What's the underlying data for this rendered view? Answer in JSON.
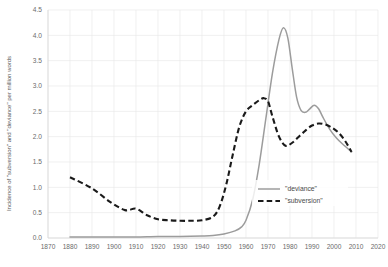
{
  "chart_data": {
    "type": "line",
    "title": "",
    "xlabel": "",
    "ylabel": "Incidence of \"subversion\" and \"deviance\" per million words",
    "xlim": [
      1870,
      2020
    ],
    "ylim": [
      0.0,
      4.5
    ],
    "xticks": [
      1870,
      1880,
      1890,
      1900,
      1910,
      1920,
      1930,
      1940,
      1950,
      1960,
      1970,
      1980,
      1990,
      2000,
      2010,
      2020
    ],
    "yticks": [
      0.0,
      0.5,
      1.0,
      1.5,
      2.0,
      2.5,
      3.0,
      3.5,
      4.0,
      4.5
    ],
    "grid": true,
    "legend_position": "lower right",
    "series": [
      {
        "name": "\"deviance\"",
        "style": "solid",
        "color": "#9c9c9c",
        "x": [
          1880,
          1890,
          1900,
          1910,
          1920,
          1930,
          1940,
          1945,
          1950,
          1955,
          1958,
          1960,
          1963,
          1966,
          1969,
          1972,
          1975,
          1977,
          1979,
          1981,
          1983,
          1985,
          1987,
          1989,
          1991,
          1993,
          1995,
          1998,
          2001,
          2004,
          2008
        ],
        "values": [
          0.02,
          0.02,
          0.02,
          0.02,
          0.03,
          0.03,
          0.04,
          0.05,
          0.08,
          0.14,
          0.22,
          0.35,
          0.75,
          1.45,
          2.35,
          3.25,
          3.92,
          4.15,
          3.95,
          3.35,
          2.78,
          2.52,
          2.48,
          2.55,
          2.62,
          2.55,
          2.38,
          2.15,
          1.98,
          1.85,
          1.7
        ]
      },
      {
        "name": "\"subversion\"",
        "style": "dashed",
        "color": "#1a1a1a",
        "x": [
          1880,
          1890,
          1898,
          1905,
          1910,
          1915,
          1920,
          1925,
          1930,
          1935,
          1940,
          1945,
          1948,
          1951,
          1954,
          1957,
          1960,
          1963,
          1966,
          1968,
          1970,
          1972,
          1975,
          1978,
          1981,
          1984,
          1987,
          1990,
          1993,
          1996,
          1999,
          2002,
          2005,
          2008
        ],
        "values": [
          1.2,
          0.98,
          0.72,
          0.55,
          0.58,
          0.45,
          0.37,
          0.35,
          0.34,
          0.34,
          0.35,
          0.42,
          0.62,
          1.05,
          1.65,
          2.2,
          2.5,
          2.62,
          2.72,
          2.76,
          2.7,
          2.4,
          2.0,
          1.82,
          1.88,
          2.0,
          2.12,
          2.22,
          2.26,
          2.24,
          2.18,
          2.08,
          1.92,
          1.7
        ]
      }
    ],
    "legend": [
      {
        "label": "\"deviance\"",
        "style": "solid",
        "color": "#9c9c9c"
      },
      {
        "label": "\"subversion\"",
        "style": "dashed",
        "color": "#1a1a1a"
      }
    ]
  }
}
